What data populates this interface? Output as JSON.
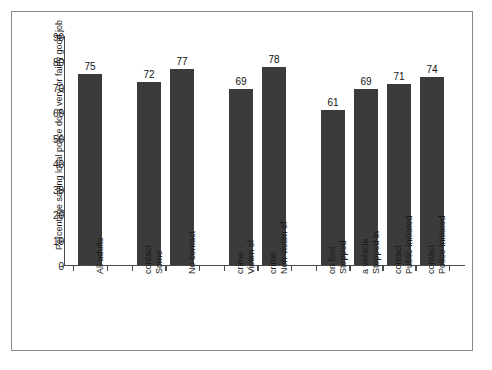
{
  "chart_data": {
    "type": "bar",
    "title": "",
    "xlabel": "",
    "ylabel": "Percentage saying local police do a very or fairly good job",
    "ylim": [
      0,
      90
    ],
    "yticks": [
      0,
      10,
      20,
      30,
      40,
      50,
      60,
      70,
      80,
      90
    ],
    "grid": false,
    "legend": "none",
    "bar_color": "#3b3b3b",
    "categories": [
      "All adults",
      "Some contact",
      "No contact",
      "Victim of crime",
      "Non-victim of crime",
      "Stopped on foot",
      "Stopped in a vehicle",
      "Public-initiated contact",
      "Police-initiated contact"
    ],
    "category_lines": [
      [
        "All adults"
      ],
      [
        "Some",
        "contact"
      ],
      [
        "No contact"
      ],
      [
        "Victim of",
        "crime"
      ],
      [
        "Non-victim of",
        "crime"
      ],
      [
        "Stopped",
        "on foot"
      ],
      [
        "Stopped in",
        "a vehicle"
      ],
      [
        "Public-initiated",
        "contact"
      ],
      [
        "Police-initiated",
        "contact"
      ]
    ],
    "values": [
      75,
      72,
      77,
      69,
      78,
      61,
      69,
      71,
      74
    ],
    "groups": [
      {
        "label": "",
        "indices": [
          0
        ]
      },
      {
        "label": "",
        "indices": [
          1,
          2
        ]
      },
      {
        "label": "",
        "indices": [
          3,
          4
        ]
      },
      {
        "label": "",
        "indices": [
          5,
          6,
          7,
          8
        ]
      }
    ]
  }
}
